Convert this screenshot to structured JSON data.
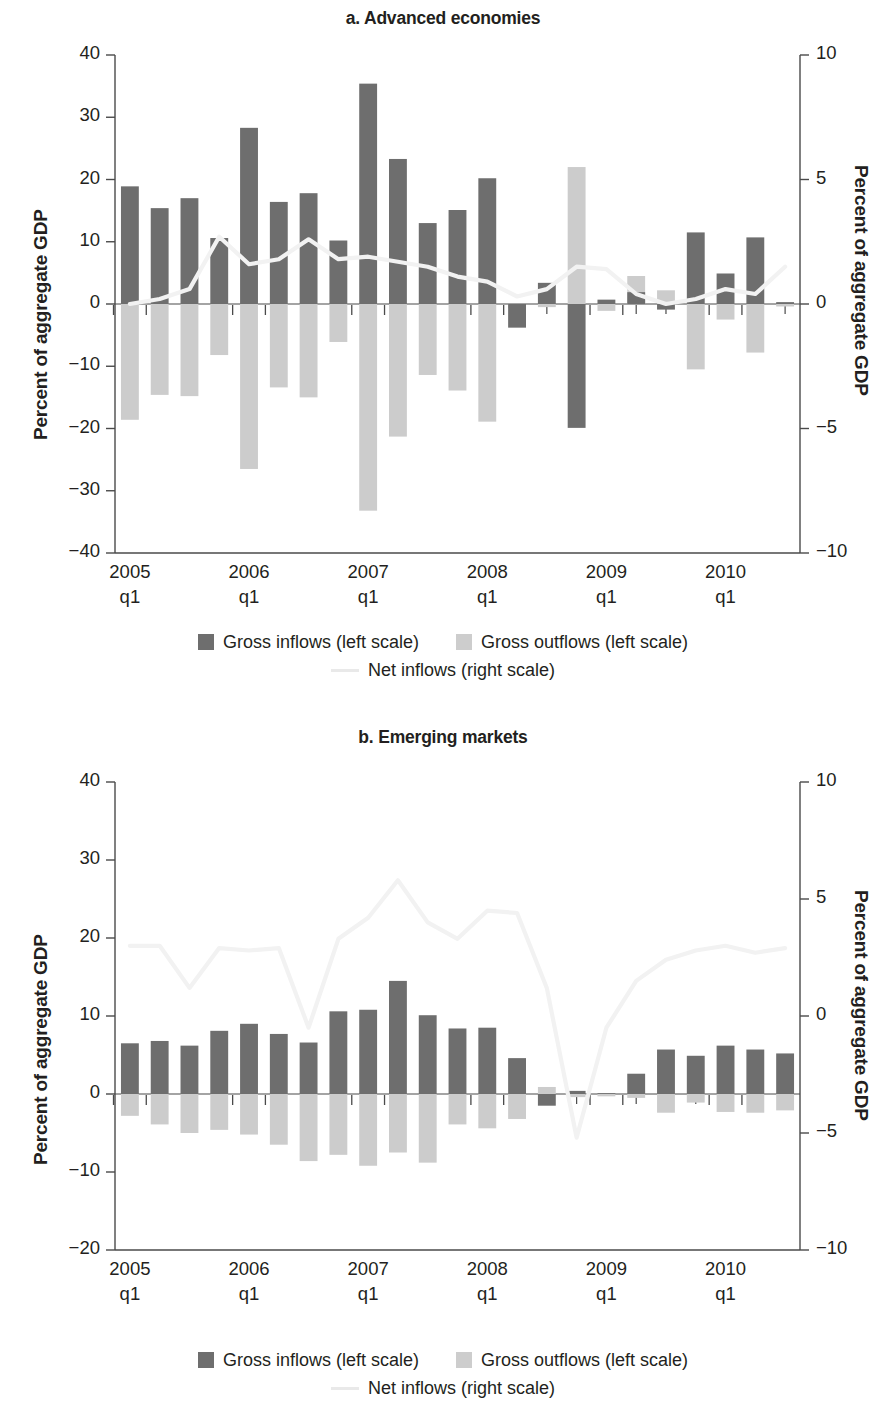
{
  "figure": {
    "colors": {
      "inflows": "#6e6e6e",
      "outflows": "#cccccc",
      "netline": "#f2f2f2",
      "axis": "#4a4a4a",
      "text": "#231f20"
    },
    "legend": {
      "inflows_label": "Gross inflows (left scale)",
      "outflows_label": "Gross outflows (left scale)",
      "net_label": "Net inflows (right scale)"
    }
  },
  "chart_data": [
    {
      "type": "bar",
      "panel": "a",
      "title": "a. Advanced economies",
      "xlabel": "",
      "ylabel": "Percent of aggregate GDP",
      "y2label": "Percent of aggregate GDP",
      "ylim": [
        -40,
        40
      ],
      "y2lim": [
        -10,
        10
      ],
      "yticks": [
        40,
        30,
        20,
        10,
        0,
        -10,
        -20,
        -30,
        -40
      ],
      "ytick_labels": [
        "40",
        "30",
        "20",
        "10",
        "0",
        "−10",
        "−20",
        "−30",
        "−40"
      ],
      "y2ticks": [
        10,
        5,
        0,
        -5,
        -10
      ],
      "y2tick_labels": [
        "10",
        "5",
        "0",
        "−5",
        "−10"
      ],
      "grid": false,
      "legend_position": "below",
      "x": [
        "2005q1",
        "2005q2",
        "2005q3",
        "2005q4",
        "2006q1",
        "2006q2",
        "2006q3",
        "2006q4",
        "2007q1",
        "2007q2",
        "2007q3",
        "2007q4",
        "2008q1",
        "2008q2",
        "2008q3",
        "2008q4",
        "2009q1",
        "2009q2",
        "2009q3",
        "2009q4",
        "2010q1",
        "2010q2",
        "2010q3"
      ],
      "xtick_labels": [
        "2005",
        "2006",
        "2007",
        "2008",
        "2009",
        "2010"
      ],
      "xtick_sub": "q1",
      "xtick_indices": [
        0,
        4,
        8,
        12,
        16,
        20
      ],
      "series": [
        {
          "name": "Gross inflows (left scale)",
          "axis": "left",
          "values": [
            18.9,
            15.4,
            17.0,
            10.6,
            28.3,
            16.4,
            17.8,
            10.2,
            35.4,
            23.3,
            13.0,
            15.1,
            20.2,
            -3.8,
            3.4,
            -19.9,
            0.7,
            1.9,
            -0.9,
            11.5,
            4.9,
            10.7,
            0.3
          ]
        },
        {
          "name": "Gross outflows (left scale)",
          "axis": "left",
          "values": [
            -18.6,
            -14.6,
            -14.8,
            -8.2,
            -26.5,
            -13.4,
            -15.0,
            -6.1,
            -33.2,
            -21.3,
            -11.4,
            -13.9,
            -18.9,
            -0.6,
            -0.5,
            22.0,
            -1.1,
            4.5,
            2.2,
            -10.5,
            -2.5,
            -7.8,
            -0.4
          ]
        },
        {
          "name": "Net inflows (right scale)",
          "axis": "right",
          "values": [
            0.0,
            0.2,
            0.6,
            2.7,
            1.6,
            1.8,
            2.6,
            1.8,
            1.9,
            1.7,
            1.5,
            1.1,
            0.9,
            0.3,
            0.6,
            1.5,
            1.4,
            0.4,
            0.0,
            0.2,
            0.6,
            0.4,
            1.5
          ]
        }
      ]
    },
    {
      "type": "bar",
      "panel": "b",
      "title": "b. Emerging markets",
      "xlabel": "",
      "ylabel": "Percent of aggregate GDP",
      "y2label": "Percent of aggregate GDP",
      "ylim": [
        -20,
        40
      ],
      "y2lim": [
        -10,
        10
      ],
      "yticks": [
        40,
        30,
        20,
        10,
        0,
        -10,
        -20
      ],
      "ytick_labels": [
        "40",
        "30",
        "20",
        "10",
        "0",
        "−10",
        "−20"
      ],
      "y2ticks": [
        10,
        5,
        0,
        -5,
        -10
      ],
      "y2tick_labels": [
        "10",
        "5",
        "0",
        "−5",
        "−10"
      ],
      "grid": false,
      "legend_position": "below",
      "x": [
        "2005q1",
        "2005q2",
        "2005q3",
        "2005q4",
        "2006q1",
        "2006q2",
        "2006q3",
        "2006q4",
        "2007q1",
        "2007q2",
        "2007q3",
        "2007q4",
        "2008q1",
        "2008q2",
        "2008q3",
        "2008q4",
        "2009q1",
        "2009q2",
        "2009q3",
        "2009q4",
        "2010q1",
        "2010q2",
        "2010q3"
      ],
      "xtick_labels": [
        "2005",
        "2006",
        "2007",
        "2008",
        "2009",
        "2010"
      ],
      "xtick_sub": "q1",
      "xtick_indices": [
        0,
        4,
        8,
        12,
        16,
        20
      ],
      "series": [
        {
          "name": "Gross inflows (left scale)",
          "axis": "left",
          "values": [
            6.5,
            6.8,
            6.2,
            8.1,
            9.0,
            7.7,
            6.6,
            10.6,
            10.8,
            14.5,
            10.1,
            8.4,
            8.5,
            4.6,
            -1.5,
            0.4,
            0.1,
            2.6,
            5.7,
            4.9,
            6.2,
            5.7,
            5.2
          ]
        },
        {
          "name": "Gross outflows (left scale)",
          "axis": "left",
          "values": [
            -2.8,
            -3.9,
            -5.0,
            -4.6,
            -5.2,
            -6.5,
            -8.6,
            -7.8,
            -9.2,
            -7.5,
            -8.8,
            -3.9,
            -4.4,
            -3.2,
            0.9,
            -0.4,
            -0.3,
            -0.5,
            -2.4,
            -1.1,
            -2.3,
            -2.4,
            -2.1
          ]
        },
        {
          "name": "Net inflows (right scale)",
          "axis": "right",
          "values": [
            3.0,
            3.0,
            1.2,
            2.9,
            2.8,
            2.9,
            -0.5,
            3.3,
            4.2,
            5.8,
            4.0,
            3.3,
            4.5,
            4.4,
            1.2,
            -5.2,
            -0.5,
            1.5,
            2.4,
            2.8,
            3.0,
            2.7,
            2.9
          ]
        }
      ]
    }
  ]
}
